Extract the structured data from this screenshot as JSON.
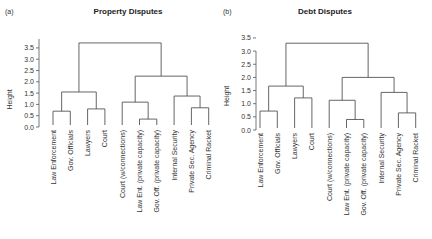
{
  "chart_data": [
    {
      "type": "dendrogram",
      "panel_label": "(a)",
      "title": "Property Disputes",
      "ylabel": "Height",
      "ylim": [
        0,
        3.9
      ],
      "yticks": [
        0.0,
        0.5,
        1.0,
        1.5,
        2.0,
        2.5,
        3.0,
        3.5
      ],
      "ytick_labels": [
        "0.0",
        "0.5",
        "1.0",
        "1.5",
        "2.0",
        "2.5",
        "3.0",
        "3.5"
      ],
      "leaves": [
        "Law Enforcement",
        "Gov. Officials",
        "Lawyers",
        "Court",
        "Court (w/connections)",
        "Law Ent. (private capacity)",
        "Gov. Off. (private capacity)",
        "Internal Security",
        "Private Sec. Agency",
        "Criminal Racket"
      ],
      "merges": [
        {
          "left": 0,
          "right": 1,
          "height": 0.7
        },
        {
          "left": 2,
          "right": 3,
          "height": 0.8
        },
        {
          "left": "m0",
          "right": "m1",
          "height": 1.55
        },
        {
          "left": 5,
          "right": 6,
          "height": 0.35
        },
        {
          "left": 4,
          "right": "m3",
          "height": 1.1
        },
        {
          "left": 8,
          "right": 9,
          "height": 0.85
        },
        {
          "left": 7,
          "right": "m5",
          "height": 1.37
        },
        {
          "left": "m4",
          "right": "m6",
          "height": 2.25
        },
        {
          "left": "m2",
          "right": "m7",
          "height": 3.72
        }
      ]
    },
    {
      "type": "dendrogram",
      "panel_label": "(b)",
      "title": "Debt Disputes",
      "ylabel": "Height",
      "ylim": [
        0,
        3.5
      ],
      "yticks": [
        0.0,
        0.5,
        1.0,
        1.5,
        2.0,
        2.5,
        3.0,
        3.5
      ],
      "ytick_labels": [
        "0.0",
        "0.5",
        "1.0",
        "1.5",
        "2.0",
        "2.5",
        "3.0",
        "3.5"
      ],
      "leaves": [
        "Law Enforcement",
        "Gov. Officials",
        "Lawyers",
        "Court",
        "Court (w/connections)",
        "Law Ent. (private capacity)",
        "Gov. Off. (private capacity)",
        "Internal Security",
        "Private Sec. Agency",
        "Criminal Racket"
      ],
      "merges": [
        {
          "left": 0,
          "right": 1,
          "height": 0.72
        },
        {
          "left": 2,
          "right": 3,
          "height": 1.22
        },
        {
          "left": "m0",
          "right": "m1",
          "height": 1.67
        },
        {
          "left": 5,
          "right": 6,
          "height": 0.4
        },
        {
          "left": 4,
          "right": "m3",
          "height": 1.13
        },
        {
          "left": 8,
          "right": 9,
          "height": 0.65
        },
        {
          "left": 7,
          "right": "m5",
          "height": 1.43
        },
        {
          "left": "m4",
          "right": "m6",
          "height": 2.0
        },
        {
          "left": "m2",
          "right": "m7",
          "height": 3.3
        }
      ]
    }
  ]
}
